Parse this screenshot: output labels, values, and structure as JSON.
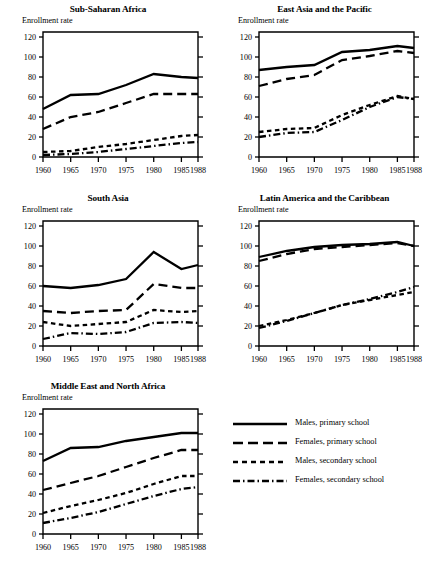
{
  "figure": {
    "y_axis_label": "Enrollment rate",
    "y_ticks": [
      0,
      20,
      40,
      60,
      80,
      100,
      120
    ],
    "x_ticks": [
      1960,
      1965,
      1970,
      1975,
      1980,
      1985,
      1988
    ],
    "ylim": [
      0,
      125
    ],
    "xlim": [
      1960,
      1988
    ],
    "line_color": "#000000"
  },
  "legend": {
    "items": [
      {
        "label": "Males, primary school",
        "style": "solid"
      },
      {
        "label": "Females, primary school",
        "style": "dashed"
      },
      {
        "label": "Males, secondary school",
        "style": "dotted"
      },
      {
        "label": "Females, secondary school",
        "style": "dashdot"
      }
    ]
  },
  "chart_data": [
    {
      "type": "line",
      "title": "Sub-Saharan Africa",
      "xlabel": "",
      "ylabel": "Enrollment rate",
      "ylim": [
        0,
        125
      ],
      "grid": false,
      "legend_position": "external",
      "x": [
        1960,
        1965,
        1970,
        1975,
        1980,
        1985,
        1988
      ],
      "series": [
        {
          "name": "Males, primary school",
          "style": "solid",
          "values": [
            48,
            62,
            63,
            72,
            83,
            80,
            79
          ]
        },
        {
          "name": "Females, primary school",
          "style": "dashed",
          "values": [
            28,
            40,
            45,
            54,
            63,
            63,
            63
          ]
        },
        {
          "name": "Males, secondary school",
          "style": "dotted",
          "values": [
            5,
            6,
            10,
            13,
            17,
            21,
            22
          ]
        },
        {
          "name": "Females, secondary school",
          "style": "dashdot",
          "values": [
            2,
            3,
            5,
            8,
            11,
            14,
            15
          ]
        }
      ]
    },
    {
      "type": "line",
      "title": "East Asia and the Pacific",
      "xlabel": "",
      "ylabel": "Enrollment rate",
      "ylim": [
        0,
        125
      ],
      "grid": false,
      "legend_position": "external",
      "x": [
        1960,
        1965,
        1970,
        1975,
        1980,
        1985,
        1988
      ],
      "series": [
        {
          "name": "Males, primary school",
          "style": "solid",
          "values": [
            87,
            90,
            92,
            105,
            107,
            111,
            109
          ]
        },
        {
          "name": "Females, primary school",
          "style": "dashed",
          "values": [
            71,
            78,
            82,
            97,
            101,
            106,
            104
          ]
        },
        {
          "name": "Males, secondary school",
          "style": "dotted",
          "values": [
            25,
            28,
            29,
            42,
            52,
            61,
            58
          ]
        },
        {
          "name": "Females, secondary school",
          "style": "dashdot",
          "values": [
            20,
            24,
            25,
            37,
            50,
            60,
            58
          ]
        }
      ]
    },
    {
      "type": "line",
      "title": "South Asia",
      "xlabel": "",
      "ylabel": "Enrollment rate",
      "ylim": [
        0,
        125
      ],
      "grid": false,
      "legend_position": "external",
      "x": [
        1960,
        1965,
        1970,
        1975,
        1980,
        1985,
        1988
      ],
      "series": [
        {
          "name": "Males, primary school",
          "style": "solid",
          "values": [
            60,
            58,
            61,
            67,
            94,
            77,
            81
          ]
        },
        {
          "name": "Females, primary school",
          "style": "dashed",
          "values": [
            35,
            33,
            35,
            36,
            62,
            58,
            58
          ]
        },
        {
          "name": "Males, secondary school",
          "style": "dotted",
          "values": [
            24,
            20,
            22,
            24,
            36,
            34,
            35
          ]
        },
        {
          "name": "Females, secondary school",
          "style": "dashdot",
          "values": [
            7,
            13,
            12,
            14,
            23,
            24,
            23
          ]
        }
      ]
    },
    {
      "type": "line",
      "title": "Latin America and the Caribbean",
      "xlabel": "",
      "ylabel": "Enrollment rate",
      "ylim": [
        0,
        125
      ],
      "grid": false,
      "legend_position": "external",
      "x": [
        1960,
        1965,
        1970,
        1975,
        1980,
        1985,
        1988
      ],
      "series": [
        {
          "name": "Males, primary school",
          "style": "solid",
          "values": [
            89,
            95,
            99,
            101,
            102,
            104,
            100
          ]
        },
        {
          "name": "Females, primary school",
          "style": "dashed",
          "values": [
            85,
            92,
            97,
            99,
            101,
            103,
            100
          ]
        },
        {
          "name": "Males, secondary school",
          "style": "dotted",
          "values": [
            20,
            26,
            33,
            41,
            46,
            51,
            54
          ]
        },
        {
          "name": "Females, secondary school",
          "style": "dashdot",
          "values": [
            18,
            25,
            33,
            41,
            47,
            54,
            59
          ]
        }
      ]
    },
    {
      "type": "line",
      "title": "Middle East and North Africa",
      "xlabel": "",
      "ylabel": "Enrollment rate",
      "ylim": [
        0,
        125
      ],
      "grid": false,
      "legend_position": "external",
      "x": [
        1960,
        1965,
        1970,
        1975,
        1980,
        1985,
        1988
      ],
      "series": [
        {
          "name": "Males, primary school",
          "style": "solid",
          "values": [
            73,
            86,
            87,
            93,
            97,
            101,
            101
          ]
        },
        {
          "name": "Females, primary school",
          "style": "dashed",
          "values": [
            44,
            51,
            58,
            67,
            76,
            84,
            84
          ]
        },
        {
          "name": "Males, secondary school",
          "style": "dotted",
          "values": [
            21,
            28,
            34,
            41,
            50,
            58,
            58
          ]
        },
        {
          "name": "Females, secondary school",
          "style": "dashdot",
          "values": [
            11,
            16,
            22,
            30,
            38,
            45,
            47
          ]
        }
      ]
    }
  ]
}
